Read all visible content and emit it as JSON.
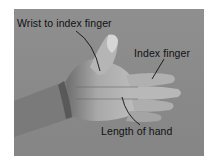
{
  "figure": {
    "background_color": "#8a8a8a",
    "labels": [
      {
        "id": "wrist-to-index",
        "text": "Wrist to index finger"
      },
      {
        "id": "index-finger",
        "text": "Index finger"
      },
      {
        "id": "length-of-hand",
        "text": "Length of hand"
      }
    ]
  }
}
